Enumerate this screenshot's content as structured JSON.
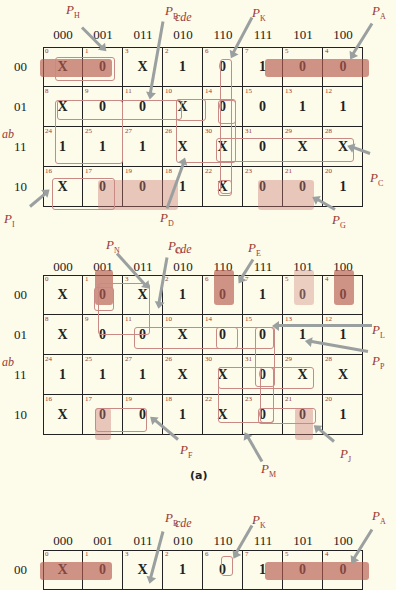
{
  "axis": {
    "col_var": "cde",
    "row_var": "ab"
  },
  "col_headers": [
    "000",
    "001",
    "011",
    "010",
    "110",
    "111",
    "101",
    "100"
  ],
  "row_headers": [
    "00",
    "01",
    "11",
    "10"
  ],
  "cell_indices": [
    [
      "0",
      "1",
      "3",
      "2",
      "6",
      "7",
      "5",
      "4"
    ],
    [
      "8",
      "9",
      "11",
      "10",
      "14",
      "15",
      "13",
      "12"
    ],
    [
      "24",
      "25",
      "27",
      "26",
      "30",
      "31",
      "29",
      "28"
    ],
    [
      "16",
      "17",
      "19",
      "18",
      "22",
      "23",
      "21",
      "20"
    ]
  ],
  "map1": {
    "values": [
      [
        "X",
        "0",
        "X",
        "1",
        "0",
        "1",
        "0",
        "0"
      ],
      [
        "X",
        "0",
        "0",
        "X",
        "0",
        "0",
        "1",
        "1"
      ],
      [
        "1",
        "1",
        "1",
        "X",
        "X",
        "0",
        "X",
        "X"
      ],
      [
        "X",
        "0",
        "0",
        "1",
        "X",
        "0",
        "0",
        "1"
      ]
    ],
    "labels": {
      "PH": {
        "p": "P",
        "s": "H"
      },
      "PB": {
        "p": "P",
        "s": "B"
      },
      "PK": {
        "p": "P",
        "s": "K"
      },
      "PA": {
        "p": "P",
        "s": "A"
      },
      "PC": {
        "p": "P",
        "s": "C"
      },
      "PI": {
        "p": "P",
        "s": "I"
      },
      "PD": {
        "p": "P",
        "s": "D"
      },
      "PG": {
        "p": "P",
        "s": "G"
      }
    }
  },
  "map2": {
    "values": [
      [
        "X",
        "0",
        "X",
        "1",
        "0",
        "1",
        "0",
        "0"
      ],
      [
        "X",
        "0",
        "0",
        "X",
        "0",
        "0",
        "1",
        "1"
      ],
      [
        "1",
        "1",
        "1",
        "X",
        "X",
        "0",
        "X",
        "X"
      ],
      [
        "X",
        "0",
        "0",
        "1",
        "X",
        "0",
        "0",
        "1"
      ]
    ],
    "labels": {
      "PN": {
        "p": "P",
        "s": "N"
      },
      "PO": {
        "p": "P",
        "s": "O"
      },
      "PE": {
        "p": "P",
        "s": "E"
      },
      "PL": {
        "p": "P",
        "s": "L"
      },
      "PP": {
        "p": "P",
        "s": "P"
      },
      "PF": {
        "p": "P",
        "s": "F"
      },
      "PM": {
        "p": "P",
        "s": "M"
      },
      "PJ": {
        "p": "P",
        "s": "J"
      }
    },
    "caption": "(a)"
  },
  "map3": {
    "values": [
      [
        "X",
        "0",
        "X",
        "1",
        "0",
        "1",
        "0",
        "0"
      ]
    ],
    "labels": {
      "PB": {
        "p": "P",
        "s": "B"
      },
      "PK": {
        "p": "P",
        "s": "K"
      },
      "PA": {
        "p": "P",
        "s": "A"
      }
    }
  }
}
